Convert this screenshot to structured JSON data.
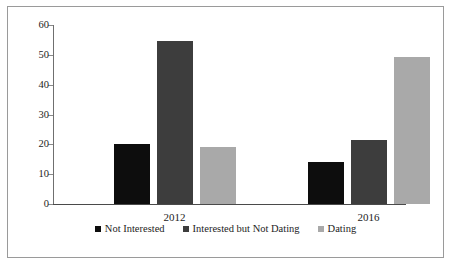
{
  "chart_data": {
    "type": "bar",
    "title": "",
    "subtitle": "",
    "xlabel": "",
    "ylabel": "",
    "categories": [
      "2012",
      "2016"
    ],
    "series": [
      {
        "name": "Not Interested",
        "color": "#0d0d0d",
        "values": [
          20.2,
          14.2
        ]
      },
      {
        "name": "Interested but Not Dating",
        "color": "#3d3d3d",
        "values": [
          54.5,
          21.4
        ]
      },
      {
        "name": "Dating",
        "color": "#a9a9a9",
        "values": [
          19.0,
          49.3
        ]
      }
    ],
    "ylim": [
      0,
      60
    ],
    "y_ticks": [
      0,
      10,
      20,
      30,
      40,
      50,
      60
    ],
    "y_tick_labels": [
      "0",
      "10",
      "20",
      "30",
      "40",
      "50",
      "60"
    ],
    "grid": false,
    "legend_position": "bottom",
    "border": true,
    "border_color": "#9a9a9a",
    "background": "#ffffff"
  }
}
